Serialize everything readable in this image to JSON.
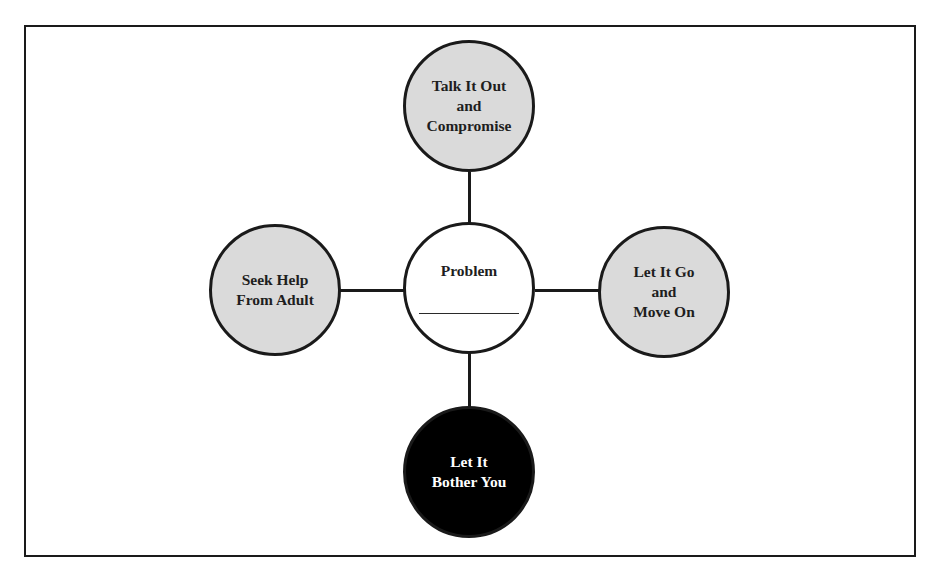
{
  "diagram": {
    "type": "hub-and-spoke",
    "center": {
      "label": "Problem",
      "blank_line": true,
      "fill": "#ffffff"
    },
    "nodes": {
      "top": {
        "lines": [
          "Talk It Out",
          "and",
          "Compromise"
        ],
        "fill": "#dadada"
      },
      "left": {
        "lines": [
          "Seek Help",
          "From Adult"
        ],
        "fill": "#dadada"
      },
      "right": {
        "lines": [
          "Let It Go",
          "and",
          "Move On"
        ],
        "fill": "#dadada"
      },
      "bottom": {
        "lines": [
          "Let It",
          "Bother You"
        ],
        "fill": "#000000",
        "text_color": "#ffffff"
      }
    },
    "colors": {
      "stroke": "#1a1a1a",
      "gray_fill": "#dadada",
      "background": "#ffffff"
    }
  }
}
